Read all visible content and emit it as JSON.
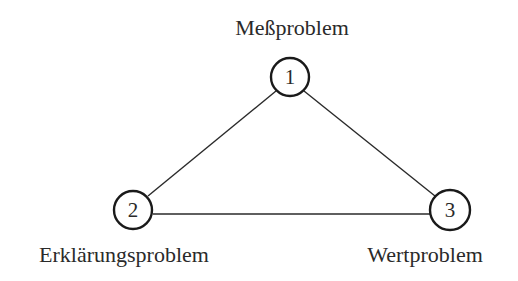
{
  "diagram": {
    "type": "triangle",
    "nodes": [
      {
        "id": "1",
        "number": "1",
        "label": "Meßproblem"
      },
      {
        "id": "2",
        "number": "2",
        "label": "Erklärungsproblem"
      },
      {
        "id": "3",
        "number": "3",
        "label": "Wertproblem"
      }
    ],
    "edges": [
      {
        "from": "1",
        "to": "2"
      },
      {
        "from": "1",
        "to": "3"
      },
      {
        "from": "2",
        "to": "3"
      }
    ]
  },
  "colors": {
    "stroke": "#1a1a1a",
    "text": "#2a2a2a",
    "background": "#ffffff"
  }
}
